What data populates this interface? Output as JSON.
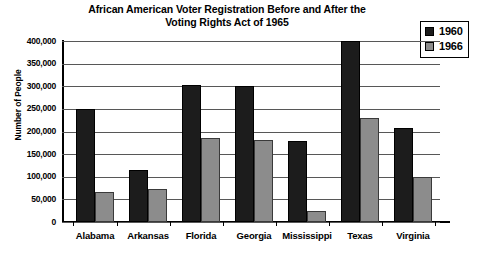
{
  "chart_data": {
    "type": "bar",
    "title": "African American Voter Registration Before and After the Voting Rights Act of 1965",
    "title_lines": [
      "African American Voter Registration Before and After the",
      "Voting Rights Act of 1965"
    ],
    "xlabel": "",
    "ylabel": "Number of People",
    "ylim": [
      0,
      400000
    ],
    "ytick_values": [
      0,
      50000,
      100000,
      150000,
      200000,
      250000,
      300000,
      350000,
      400000
    ],
    "ytick_labels": [
      "0",
      "50,000",
      "100,000",
      "150,000",
      "200,000",
      "250,000",
      "300,000",
      "350,000",
      "400,000"
    ],
    "grid": true,
    "legend_position": "top-right",
    "categories": [
      "Alabama",
      "Arkansas",
      "Florida",
      "Georgia",
      "Mississippi",
      "Texas",
      "Virginia"
    ],
    "series": [
      {
        "name": "1960",
        "color": "#1c1c1c",
        "values": [
          250000,
          115000,
          303000,
          300000,
          178000,
          400000,
          208000
        ]
      },
      {
        "name": "1966",
        "color": "#8c8c8c",
        "values": [
          66000,
          72000,
          185000,
          182000,
          24000,
          230000,
          100000
        ]
      }
    ]
  },
  "legend": {
    "entries": [
      {
        "label": "1960",
        "color": "#1c1c1c"
      },
      {
        "label": "1966",
        "color": "#8c8c8c"
      }
    ]
  }
}
